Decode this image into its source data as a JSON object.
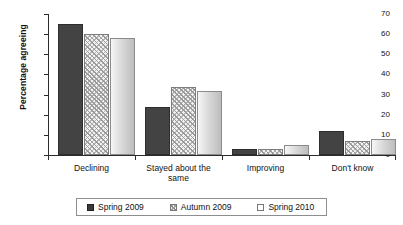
{
  "chart_data": {
    "type": "bar",
    "title": "",
    "xlabel": "",
    "ylabel": "Percentage agreeing",
    "ylim": [
      0,
      70
    ],
    "yticks": [
      0,
      10,
      20,
      30,
      40,
      50,
      60,
      70
    ],
    "grid": false,
    "legend_position": "bottom",
    "categories": [
      "Declining",
      "Stayed about the same",
      "Improving",
      "Don't know"
    ],
    "series": [
      {
        "name": "Spring 2009",
        "style": "solid-dark",
        "color": "#434343",
        "values": [
          65,
          24,
          3,
          12
        ]
      },
      {
        "name": "Autumn 2009",
        "style": "hatched",
        "color": "#f2f2f2",
        "values": [
          60,
          34,
          3,
          7
        ]
      },
      {
        "name": "Spring 2010",
        "style": "light-gradient",
        "color": "#d4d4d4",
        "values": [
          58,
          32,
          5,
          8
        ]
      }
    ]
  },
  "axis": {
    "y_title": "Percentage agreeing",
    "y_tick_labels": [
      "70",
      "60",
      "50",
      "40",
      "30",
      "20",
      "10",
      "0"
    ]
  },
  "categories": [
    {
      "label_line1": "Declining",
      "label_line2": ""
    },
    {
      "label_line1": "Stayed about the",
      "label_line2": "same"
    },
    {
      "label_line1": "Improving",
      "label_line2": ""
    },
    {
      "label_line1": "Don't know",
      "label_line2": ""
    }
  ],
  "legend": {
    "items": [
      {
        "label": "Spring 2009"
      },
      {
        "label": "Autumn 2009"
      },
      {
        "label": "Spring 2010"
      }
    ]
  }
}
